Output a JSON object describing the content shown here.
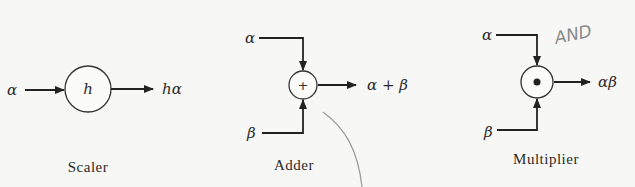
{
  "diagram": {
    "scaler": {
      "input": "α",
      "gain": "h",
      "output": "hα",
      "caption": "Scaler"
    },
    "adder": {
      "input_top": "α",
      "input_bottom": "β",
      "operator": "+",
      "output": "α + β",
      "caption": "Adder"
    },
    "multiplier": {
      "input_top": "α",
      "input_bottom": "β",
      "operator": "•",
      "output": "αβ",
      "caption": "Multiplier",
      "annotation": "AND"
    }
  },
  "colors": {
    "ink": "#222222",
    "background": "#f7f7f5",
    "pencil": "#8a8a8a"
  }
}
